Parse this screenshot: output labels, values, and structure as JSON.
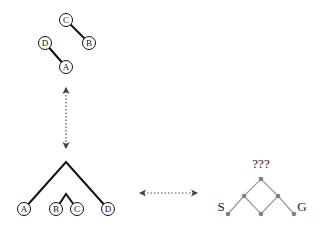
{
  "colors": {
    "ink": "#111111",
    "gray": "#8a8a8a",
    "dot": "#808080"
  },
  "top_tree": {
    "nodes": [
      {
        "id": "C",
        "label": "C",
        "x": 66,
        "y": 20
      },
      {
        "id": "B",
        "label": "B",
        "x": 89,
        "y": 43
      },
      {
        "id": "D",
        "label": "D",
        "x": 45,
        "y": 43
      },
      {
        "id": "A",
        "label": "A",
        "x": 66,
        "y": 67
      }
    ],
    "edges": [
      [
        "C",
        "B"
      ],
      [
        "D",
        "A"
      ]
    ]
  },
  "bottom_tree": {
    "leaves": [
      {
        "label": "A",
        "x": 24,
        "y": 209
      },
      {
        "label": "B",
        "x": 56,
        "y": 209
      },
      {
        "label": "C",
        "x": 77,
        "y": 209
      },
      {
        "label": "D",
        "x": 108,
        "y": 209
      }
    ],
    "apex": {
      "x": 66,
      "y": 162
    },
    "sub_apex": {
      "x": 66,
      "y": 194
    }
  },
  "lattice": {
    "question_label": "???",
    "start_label": "S",
    "goal_label": "G"
  },
  "arrows": {
    "vertical": "double-headed dotted arrow",
    "horizontal": "double-headed dotted arrow"
  }
}
